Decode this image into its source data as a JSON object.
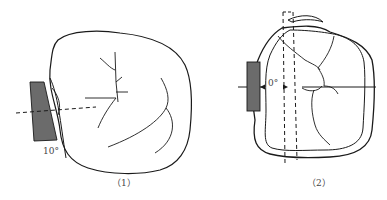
{
  "figures": [
    {
      "id": "fig1",
      "caption": "（1）",
      "angle_label": "10°",
      "description": "Occlusal outline of tooth with shaded wedge tilted 10 degrees against proximal surface, dashed reference line"
    },
    {
      "id": "fig2",
      "caption": "（2）",
      "angle_label": "0°",
      "description": "Occlusal outline of tooth with shaded rectangle parallel at 0 degrees, dashed vertical guide lines and horizontal axis"
    }
  ],
  "colors": {
    "stroke": "#1a1a1a",
    "fill_block": "#6b6b6b",
    "background": "#ffffff"
  }
}
